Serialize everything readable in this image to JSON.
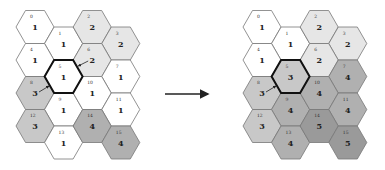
{
  "figure": {
    "colors": {
      "1": "#ffffff",
      "2": "#e6e6e6",
      "3": "#c8c8c8",
      "4": "#b0b0b0",
      "5": "#9a9a9a",
      "stroke": "#777777",
      "highlight_stroke": "#111111",
      "arrow": "#222222"
    }
  },
  "left_grid": {
    "origin_x": 35,
    "highlight_index": 5,
    "cells": [
      {
        "index": "0",
        "value": "1"
      },
      {
        "index": "1",
        "value": "1"
      },
      {
        "index": "2",
        "value": "2"
      },
      {
        "index": "3",
        "value": "2"
      },
      {
        "index": "4",
        "value": "1"
      },
      {
        "index": "5",
        "value": "1"
      },
      {
        "index": "6",
        "value": "2"
      },
      {
        "index": "7",
        "value": "1"
      },
      {
        "index": "8",
        "value": "3"
      },
      {
        "index": "9",
        "value": "1"
      },
      {
        "index": "10",
        "value": "1"
      },
      {
        "index": "11",
        "value": "1"
      },
      {
        "index": "12",
        "value": "3"
      },
      {
        "index": "13",
        "value": "1"
      },
      {
        "index": "14",
        "value": "4"
      },
      {
        "index": "15",
        "value": "4"
      }
    ]
  },
  "right_grid": {
    "origin_x": 262,
    "highlight_index": 5,
    "cells": [
      {
        "index": "0",
        "value": "1"
      },
      {
        "index": "1",
        "value": "1"
      },
      {
        "index": "2",
        "value": "2"
      },
      {
        "index": "3",
        "value": "2"
      },
      {
        "index": "4",
        "value": "1"
      },
      {
        "index": "5",
        "value": "3"
      },
      {
        "index": "6",
        "value": "2"
      },
      {
        "index": "7",
        "value": "4"
      },
      {
        "index": "8",
        "value": "3"
      },
      {
        "index": "9",
        "value": "4"
      },
      {
        "index": "10",
        "value": "4"
      },
      {
        "index": "11",
        "value": "4"
      },
      {
        "index": "12",
        "value": "3"
      },
      {
        "index": "13",
        "value": "4"
      },
      {
        "index": "14",
        "value": "5"
      },
      {
        "index": "15",
        "value": "5"
      }
    ]
  },
  "transition_arrow": {
    "icon": "right-arrow-icon",
    "x1": 165,
    "y1": 94,
    "x2": 208,
    "y2": 94
  }
}
